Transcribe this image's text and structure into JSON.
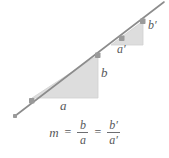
{
  "figure": {
    "colors": {
      "line": "#8c8c8c",
      "triangle_fill": "#dddddd",
      "triangle_stroke": "#c8c8c8",
      "marker": "#9a9a9a",
      "text": "#58595b"
    },
    "line": {
      "name": "diagonal-line",
      "x1": 15,
      "y1": 116,
      "x2": 164,
      "y2": 2,
      "markers": [
        {
          "x": 32,
          "y": 101
        },
        {
          "x": 98,
          "y": 55
        },
        {
          "x": 122,
          "y": 38
        },
        {
          "x": 143,
          "y": 21
        }
      ]
    },
    "triangles": [
      {
        "name": "large-triangle",
        "points": "32,98 98,98 98,55",
        "leg_horizontal_label": "a",
        "leg_vertical_label": "b"
      },
      {
        "name": "small-triangle",
        "points": "111,45 143,45 143,21",
        "leg_horizontal_label": "a'",
        "leg_vertical_label": "b'"
      }
    ],
    "labels": {
      "a": "a",
      "b": "b",
      "a_prime": "a′",
      "b_prime": "b′"
    },
    "equation": {
      "slope_symbol": "m",
      "equals_first": "=",
      "equals_second": "=",
      "fraction_one": {
        "numerator": "b",
        "denominator": "a"
      },
      "fraction_two": {
        "numerator": "b′",
        "denominator": "a′"
      },
      "plain_text": "m = b/a = b'/a'"
    }
  }
}
